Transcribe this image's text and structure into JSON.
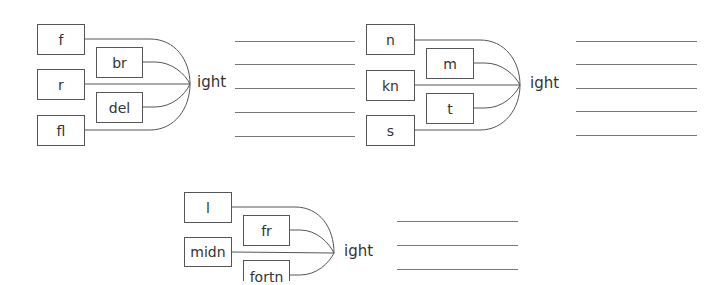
{
  "exercise": {
    "type": "word-building",
    "suffix_all": "ight",
    "stroke_color": "#555555",
    "line_color": "#777777",
    "text_color": "#333333"
  },
  "diagrams": [
    {
      "id": "diagram-1",
      "suffix": "ight",
      "outer_prefixes": [
        "f",
        "r",
        "fl"
      ],
      "inner_prefixes": [
        "br",
        "del"
      ],
      "answer_line_count": 5
    },
    {
      "id": "diagram-2",
      "suffix": "ight",
      "outer_prefixes": [
        "n",
        "kn",
        "s"
      ],
      "inner_prefixes": [
        "m",
        "t"
      ],
      "answer_line_count": 5
    },
    {
      "id": "diagram-3",
      "suffix": "ight",
      "outer_prefixes": [
        "l",
        "midn"
      ],
      "inner_prefixes": [
        "fr",
        "fortn"
      ],
      "answer_line_count": 3
    }
  ]
}
